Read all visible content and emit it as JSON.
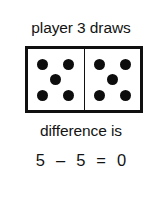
{
  "figure": {
    "caption_top": "player 3 draws",
    "caption_middle": "difference is",
    "equation": "5 – 5 = 0",
    "ink_color": "#111111",
    "background_color": "#ffffff"
  },
  "domino": {
    "left_half": {
      "pip_count": 5,
      "pip_layout": "quincunx",
      "pips": [
        {
          "name": "pip-top-left"
        },
        {
          "name": "pip-top-right"
        },
        {
          "name": "pip-center"
        },
        {
          "name": "pip-bottom-left"
        },
        {
          "name": "pip-bottom-right"
        }
      ]
    },
    "right_half": {
      "pip_count": 5,
      "pip_layout": "quincunx",
      "pips": [
        {
          "name": "pip-top-left"
        },
        {
          "name": "pip-top-right"
        },
        {
          "name": "pip-center"
        },
        {
          "name": "pip-bottom-left"
        },
        {
          "name": "pip-bottom-right"
        }
      ]
    }
  },
  "arithmetic": {
    "minuend": "5",
    "operator": "–",
    "subtrahend": "5",
    "equals": "=",
    "result": "0"
  }
}
